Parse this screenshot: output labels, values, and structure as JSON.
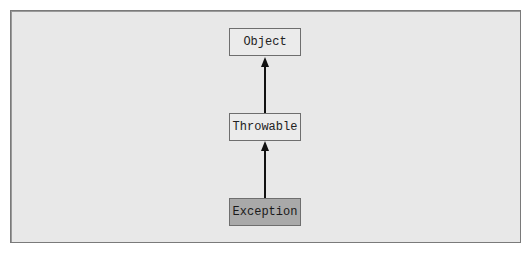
{
  "diagram": {
    "type": "class-hierarchy",
    "nodes": [
      {
        "id": "object",
        "label": "Object",
        "highlighted": false
      },
      {
        "id": "throwable",
        "label": "Throwable",
        "highlighted": false
      },
      {
        "id": "exception",
        "label": "Exception",
        "highlighted": true
      }
    ],
    "edges": [
      {
        "from": "throwable",
        "to": "object",
        "style": "arrow"
      },
      {
        "from": "exception",
        "to": "throwable",
        "style": "arrow"
      }
    ],
    "colors": {
      "background": "#e8e8e8",
      "node_fill": "#ebebeb",
      "highlight_fill": "#a9a9a9",
      "border": "#6e6e6e",
      "arrow": "#111111"
    }
  }
}
